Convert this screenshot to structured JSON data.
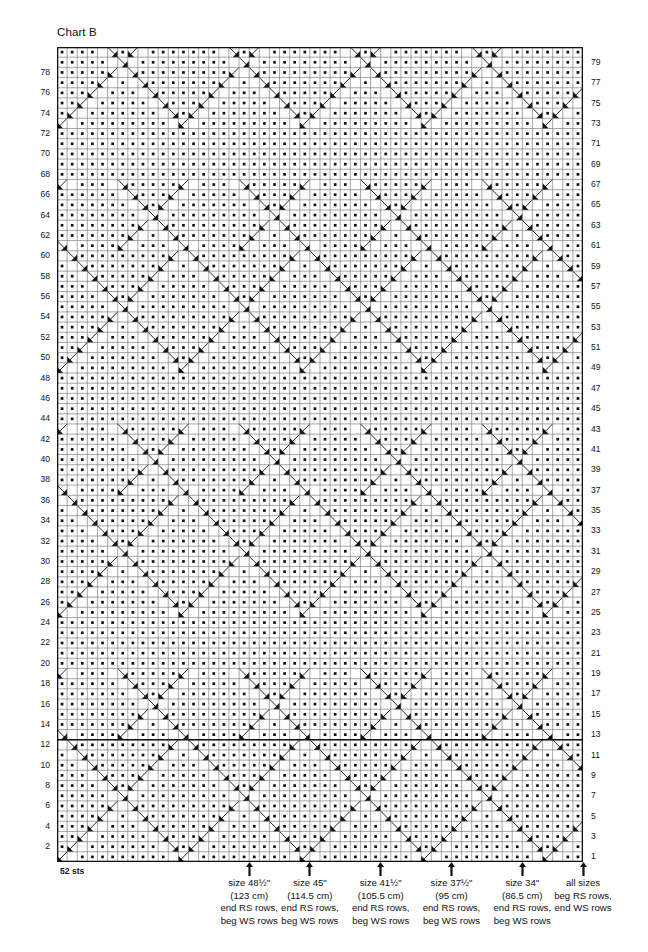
{
  "chart": {
    "title": "Chart B",
    "stitch_count_label": "52 sts",
    "columns": 52,
    "rows": 80,
    "row_numbers_left": [
      78,
      76,
      74,
      72,
      70,
      68,
      66,
      64,
      62,
      60,
      58,
      56,
      54,
      52,
      50,
      48,
      46,
      44,
      42,
      40,
      38,
      36,
      34,
      32,
      30,
      28,
      26,
      24,
      22,
      20,
      18,
      16,
      14,
      12,
      10,
      8,
      6,
      4,
      2
    ],
    "row_numbers_right": [
      79,
      77,
      75,
      73,
      71,
      69,
      67,
      65,
      63,
      61,
      59,
      57,
      55,
      53,
      51,
      49,
      47,
      45,
      43,
      41,
      39,
      37,
      35,
      33,
      31,
      29,
      27,
      25,
      23,
      21,
      19,
      17,
      15,
      13,
      11,
      9,
      7,
      5,
      3,
      1
    ],
    "colors": {
      "grid_line": "#6e6e6e",
      "border": "#111111",
      "symbol": "#111111",
      "background": "#ffffff",
      "cell_shade": "#f2f2f2"
    }
  },
  "size_markers": [
    {
      "name": "size-48-half",
      "size": "size 48½\"",
      "metric": "(123 cm)",
      "end_rows": "end RS rows,",
      "beg_rows": "beg WS rows",
      "column": 19
    },
    {
      "name": "size-45",
      "size": "size 45\"",
      "metric": "(114.5 cm)",
      "end_rows": "end RS rows,",
      "beg_rows": "beg WS rows",
      "column": 25
    },
    {
      "name": "size-41-half",
      "size": "size 41½\"",
      "metric": "(105.5 cm)",
      "end_rows": "end RS rows,",
      "beg_rows": "beg WS rows",
      "column": 32
    },
    {
      "name": "size-37-half",
      "size": "size 37½\"",
      "metric": "(95 cm)",
      "end_rows": "end RS rows,",
      "beg_rows": "beg WS rows",
      "column": 39
    },
    {
      "name": "size-34",
      "size": "size 34\"",
      "metric": "(86.5 cm)",
      "end_rows": "end RS rows,",
      "beg_rows": "beg WS rows",
      "column": 46
    },
    {
      "name": "all-sizes",
      "size": "all sizes",
      "metric": "beg RS rows,",
      "end_rows": "end WS rows",
      "beg_rows": "",
      "column": 52
    }
  ],
  "legend_symbols": [
    {
      "key": "purl",
      "name": "purl-dot-symbol",
      "glyph": "•"
    },
    {
      "key": "knit",
      "name": "knit-blank-symbol",
      "glyph": ""
    },
    {
      "key": "rt",
      "name": "right-twist-symbol",
      "glyph": "◢"
    },
    {
      "key": "lt",
      "name": "left-twist-symbol",
      "glyph": "◣"
    },
    {
      "key": "cable",
      "name": "cable-cross-symbol",
      "glyph": "✕"
    }
  ]
}
